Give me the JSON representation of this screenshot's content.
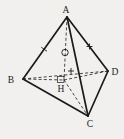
{
  "figure": {
    "name": "tetrahedron-with-altitude-diagram",
    "background": "#f1f0ee",
    "stroke_color": "#1b1b1b",
    "width": 124,
    "height": 139,
    "vertices": {
      "A": {
        "label": "A",
        "x": 67,
        "y": 17,
        "lx": 66,
        "ly": 13
      },
      "B": {
        "label": "B",
        "x": 23,
        "y": 79,
        "lx": 11,
        "ly": 83
      },
      "C": {
        "label": "C",
        "x": 88,
        "y": 116,
        "lx": 90,
        "ly": 127
      },
      "D": {
        "label": "D",
        "x": 108,
        "y": 71,
        "lx": 115,
        "ly": 75
      },
      "H": {
        "label": "H",
        "x": 64,
        "y": 80,
        "lx": 61,
        "ly": 92
      }
    },
    "solid_edges": [
      [
        "A",
        "B"
      ],
      [
        "A",
        "C"
      ],
      [
        "A",
        "D"
      ],
      [
        "B",
        "C"
      ],
      [
        "C",
        "D"
      ]
    ],
    "dashed_edges": [
      [
        "B",
        "D"
      ],
      [
        "B",
        "H"
      ],
      [
        "H",
        "D"
      ],
      [
        "H",
        "C"
      ],
      [
        "A",
        "H"
      ]
    ],
    "markers": [
      {
        "kind": "tick",
        "edge": [
          "A",
          "B"
        ],
        "t": 0.52,
        "len": 7
      },
      {
        "kind": "plus",
        "x": 89.5,
        "y": 46.5,
        "len": 6
      },
      {
        "kind": "plus",
        "x": 71,
        "y": 71,
        "len": 6
      },
      {
        "kind": "circle",
        "x": 65,
        "y": 52.5,
        "r": 3.2
      },
      {
        "kind": "right-angle",
        "x": 57.5,
        "y": 76.5,
        "w": 6.5,
        "h": 6
      }
    ],
    "style": {
      "solid_width": 1.7,
      "dashed_width": 0.8,
      "dash_pattern": "3,2.2",
      "marker_width": 0.9
    }
  }
}
